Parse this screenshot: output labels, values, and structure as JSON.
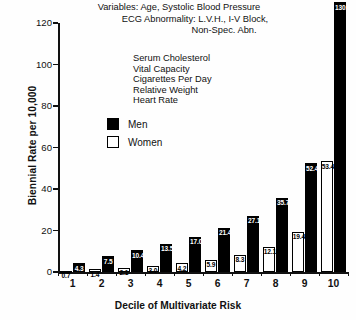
{
  "header": {
    "lines": [
      "Variables: Age, Systolic Blood Pressure",
      "ECG Abnormality: L.V.H., I-V Block,",
      "Non-Spec. Abn."
    ],
    "variable_list": [
      "Serum Cholesterol",
      "Vital Capacity",
      "Cigarettes Per Day",
      "Relative Weight",
      "Heart Rate"
    ]
  },
  "legend": {
    "items": [
      {
        "label": "Men",
        "color": "#000000",
        "style": "filled"
      },
      {
        "label": "Women",
        "color": "#ffffff",
        "style": "outlined"
      }
    ]
  },
  "chart_data": {
    "type": "bar",
    "title": "",
    "xlabel": "Decile of Multivariate Risk",
    "ylabel": "Biennial Rate per 10,000",
    "categories": [
      "1",
      "2",
      "3",
      "4",
      "5",
      "6",
      "7",
      "8",
      "9",
      "10"
    ],
    "series": [
      {
        "name": "Women",
        "color": "#ffffff",
        "values": [
          0.7,
          1.4,
          2.1,
          3.0,
          4.2,
          5.9,
          8.3,
          12.1,
          19.4,
          53.4
        ]
      },
      {
        "name": "Men",
        "color": "#000000",
        "values": [
          4.3,
          7.5,
          10.4,
          13.5,
          17.0,
          21.4,
          27.1,
          35.7,
          52.4,
          130.1
        ]
      }
    ],
    "ylim": [
      0,
      130
    ],
    "yticks": [
      0,
      20,
      40,
      60,
      80,
      100,
      120
    ],
    "grid": false,
    "legend_position": "upper-left-inside"
  }
}
